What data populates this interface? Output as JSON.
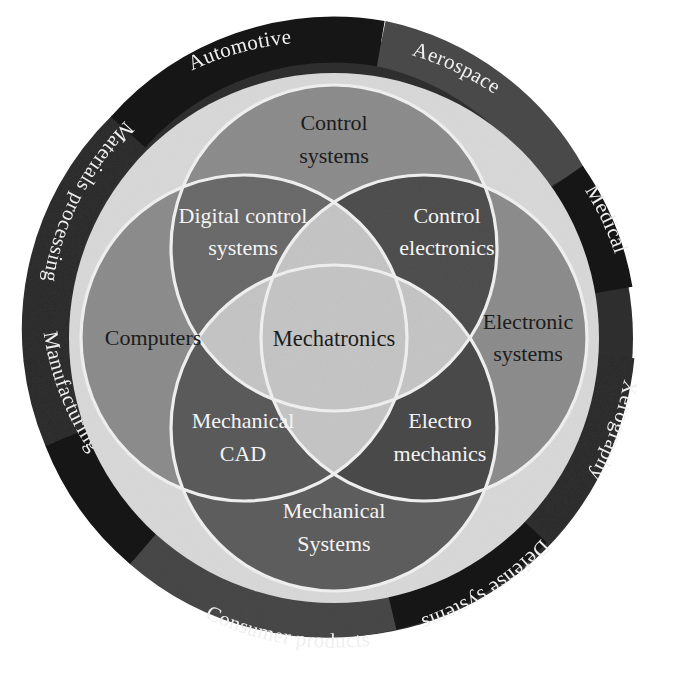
{
  "figure": {
    "center_label": "Mechatronics",
    "background_color": "#ffffff"
  },
  "colors": {
    "ring_dark": "#2a2a2a",
    "ring_darker": "#181818",
    "ring_mid": "#4a4a4a",
    "ring_light_band": "#d7d7d7",
    "circle_base": "#8f8f8f",
    "circle_overlap": "#6e6e6e",
    "circle_overlap_deep": "#5a5a5a",
    "center_fill": "#c9c9c9",
    "outline": "#f2f2f2",
    "text_dark": "#1c1c1c",
    "text_light": "#f4f4f4"
  },
  "outer_ring": {
    "name": "application-domains-ring",
    "segments": [
      {
        "label": "Aerospace",
        "start_deg": -80,
        "end_deg": -34,
        "shade": "ring_mid",
        "text_color": "#f2f2f2"
      },
      {
        "label": "Medical",
        "start_deg": -34,
        "end_deg": -2,
        "shade": "ring_darker",
        "text_color": "#f2f2f2"
      },
      {
        "label": "Xerography",
        "start_deg": 2,
        "end_deg": 48,
        "shade": "ring_dark",
        "text_color": "#f2f2f2"
      },
      {
        "label": "Defense systems",
        "start_deg": 50,
        "end_deg": 96,
        "shade": "ring_darker",
        "text_color": "#f2f2f2"
      },
      {
        "label": "Consumer products",
        "start_deg": 98,
        "end_deg": 152,
        "shade": "ring_mid",
        "text_color": "#f2f2f2"
      },
      {
        "label": "Manufacturing",
        "start_deg": 154,
        "end_deg": 196,
        "shade": "ring_darker",
        "text_color": "#f2f2f2"
      },
      {
        "label": "Materials processing",
        "start_deg": 198,
        "end_deg": 252,
        "shade": "ring_dark",
        "text_color": "#f2f2f2"
      },
      {
        "label": "Automotive",
        "start_deg": 254,
        "end_deg": 280,
        "shade": "ring_darker",
        "text_color": "#f2f2f2"
      }
    ]
  },
  "circles": {
    "top": {
      "label_line1": "Control",
      "label_line2": "systems",
      "text_tone": "dark"
    },
    "left": {
      "label_line1": "Computers",
      "label_line2": "",
      "text_tone": "dark"
    },
    "right": {
      "label_line1": "Electronic",
      "label_line2": "systems",
      "text_tone": "dark"
    },
    "bottom": {
      "label_line1": "Mechanical",
      "label_line2": "Systems",
      "text_tone": "light"
    }
  },
  "overlaps": {
    "top_left": {
      "label_line1": "Digital control",
      "label_line2": "systems",
      "text_tone": "light"
    },
    "top_right": {
      "label_line1": "Control",
      "label_line2": "electronics",
      "text_tone": "light"
    },
    "bottom_left": {
      "label_line1": "Mechanical",
      "label_line2": "CAD",
      "text_tone": "light"
    },
    "bottom_right": {
      "label_line1": "Electro",
      "label_line2": "mechanics",
      "text_tone": "light"
    }
  },
  "caption": {
    "text": ""
  }
}
